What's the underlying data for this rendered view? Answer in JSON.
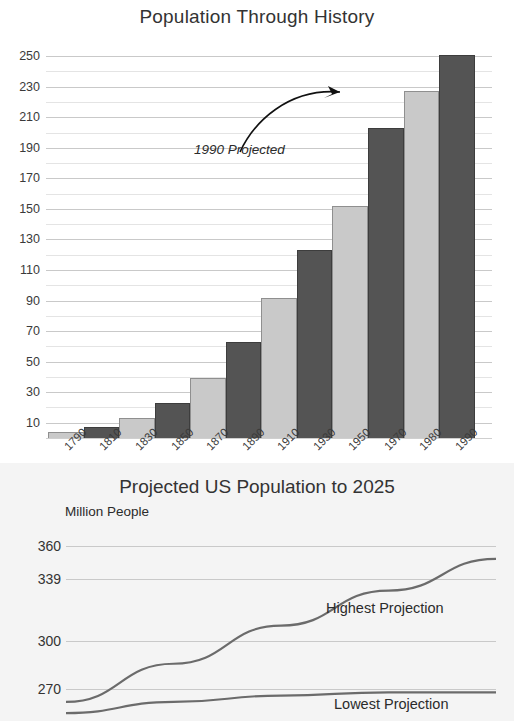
{
  "bar_chart": {
    "title": "Population Through History",
    "annotation": "1990 Projected",
    "y_ticks": [
      "250",
      "230",
      "210",
      "190",
      "170",
      "150",
      "130",
      "110",
      "90",
      "70",
      "50",
      "30",
      "10"
    ],
    "x_ticks": [
      "1790",
      "1810",
      "1830",
      "1850",
      "1870",
      "1890",
      "1910",
      "1930",
      "1950",
      "1970",
      "1980",
      "1990"
    ],
    "colors": {
      "light_bar": "#c9c9c9",
      "dark_bar": "#545454",
      "grid": "#c9c9c9"
    }
  },
  "line_chart": {
    "title": "Projected US Population to 2025",
    "axis_caption": "Million People",
    "y_ticks": [
      "360",
      "339",
      "300",
      "270"
    ],
    "label_highest": "Highest Projection",
    "label_lowest": "Lowest Projection",
    "colors": {
      "panel": "#f4f4f4",
      "line": "#6b6b6b",
      "grid": "#c9c9c9"
    }
  },
  "chart_data": [
    {
      "type": "bar",
      "title": "Population Through History",
      "xlabel": "",
      "ylabel": "",
      "categories": [
        "1790",
        "1810",
        "1830",
        "1850",
        "1870",
        "1890",
        "1910",
        "1930",
        "1950",
        "1970",
        "1980",
        "1990"
      ],
      "values": [
        4,
        7,
        13,
        23,
        39,
        63,
        92,
        123,
        152,
        203,
        227,
        251
      ],
      "bar_colors": [
        "light",
        "dark",
        "light",
        "dark",
        "light",
        "dark",
        "light",
        "dark",
        "light",
        "dark",
        "light",
        "dark"
      ],
      "ylim": [
        0,
        258
      ],
      "ytick_values": [
        250,
        230,
        210,
        190,
        170,
        150,
        130,
        110,
        90,
        70,
        50,
        30,
        10
      ],
      "minor_gridline_step": 10,
      "grid": true,
      "legend": "none",
      "annotations": [
        {
          "text": "1990 Projected",
          "points_to": "1990",
          "style": "curved-arrow"
        }
      ]
    },
    {
      "type": "line",
      "title": "Projected US Population to 2025",
      "xlabel": "",
      "ylabel": "Million People",
      "ytick_values": [
        360,
        339,
        300,
        270
      ],
      "ylim": [
        250,
        372
      ],
      "grid": true,
      "legend": "inline-labels",
      "note": "bottom of figure is cropped by the screenshot edge",
      "series": [
        {
          "name": "Highest Projection",
          "x": [
            0,
            0.25,
            0.5,
            0.75,
            1.0
          ],
          "values": [
            262,
            286,
            310,
            332,
            352
          ]
        },
        {
          "name": "Lowest Projection",
          "x": [
            0,
            0.25,
            0.5,
            0.75,
            1.0
          ],
          "values": [
            255,
            262,
            266,
            268,
            268
          ]
        }
      ]
    }
  ]
}
